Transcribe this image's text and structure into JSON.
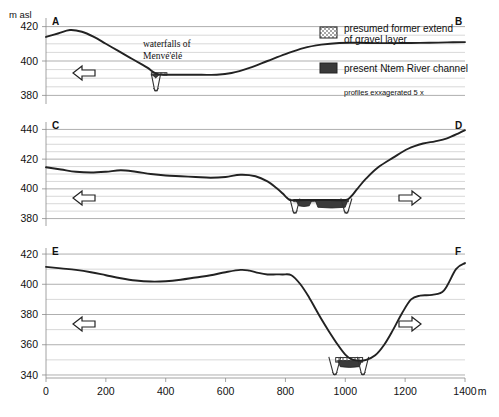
{
  "figure": {
    "y_axis_unit": "m asl",
    "x_axis_unit": "m"
  },
  "legend": {
    "items": [
      {
        "swatch": "gravel-stipple-swatch",
        "line1": "presumed former extend",
        "line2": "of gravel layer"
      },
      {
        "swatch": "channel-dark-swatch",
        "line1": "present Ntem River channel",
        "line2": ""
      }
    ],
    "note": "profiles exxagerated 5 x"
  },
  "annotations": {
    "waterfalls_line1": "waterfalls of",
    "waterfalls_line2": "Menvé'élé"
  },
  "x_ticks": [
    "0",
    "200",
    "400",
    "600",
    "800",
    "1000",
    "1200",
    "1400"
  ],
  "chart_data": {
    "type": "line",
    "title": "",
    "xlabel": "m",
    "ylabel": "m asl",
    "xlim": [
      0,
      1400
    ],
    "grid": true,
    "legend_position": "top-right",
    "note": "Three valley cross-section profiles of the Ntem River, vertically exaggerated 5x",
    "panels": [
      {
        "name": "panel-a",
        "left_label": "A",
        "right_label": "B",
        "ylim": [
          375,
          425
        ],
        "yticks": [
          380,
          400,
          420
        ],
        "yminor": [
          385,
          390,
          395,
          405,
          410,
          415
        ],
        "flow_arrow": "left",
        "x": [
          0,
          40,
          80,
          120,
          160,
          200,
          240,
          280,
          320,
          340,
          355,
          370,
          385,
          400,
          430,
          470,
          520,
          570,
          620,
          680,
          740,
          800,
          860,
          920,
          980,
          1040,
          1100,
          1160,
          1220,
          1280,
          1340,
          1400
        ],
        "y": [
          414,
          416,
          418,
          417,
          414,
          410,
          406,
          402,
          398,
          396,
          394,
          392.5,
          392.2,
          392,
          392,
          392,
          392,
          392,
          393,
          396,
          400,
          404,
          407.5,
          409.5,
          410.5,
          410.6,
          410.4,
          410.4,
          410.5,
          410.6,
          410.8,
          411
        ],
        "gravel_layer": {
          "x_start": 352,
          "x_end": 404,
          "y_top": 393.2,
          "y_bottom": 391.8
        },
        "channel": {
          "x_start": 355,
          "x_end": 378,
          "y_top": 392.2,
          "y_bottom": 390.6
        },
        "notch": {
          "x_start": 352,
          "x_end": 383,
          "y_top": 392.5,
          "y_bottom": 382.5
        }
      },
      {
        "name": "panel-c",
        "left_label": "C",
        "right_label": "D",
        "ylim": [
          375,
          445
        ],
        "yticks": [
          380,
          400,
          420,
          440
        ],
        "yminor": [
          385,
          390,
          395,
          405,
          410,
          415,
          425,
          430,
          435
        ],
        "flow_arrow_left": "left",
        "flow_arrow_right": "right",
        "x": [
          0,
          50,
          100,
          150,
          200,
          250,
          300,
          350,
          400,
          450,
          500,
          550,
          600,
          650,
          700,
          740,
          770,
          790,
          805,
          815,
          840,
          900,
          950,
          1000,
          1020,
          1040,
          1070,
          1110,
          1160,
          1210,
          1260,
          1300,
          1340,
          1380,
          1400
        ],
        "y": [
          414.5,
          413,
          411.5,
          411,
          411.5,
          412.5,
          411.5,
          410,
          409,
          408.5,
          408,
          407.5,
          408,
          409.5,
          408.5,
          405,
          400.5,
          397,
          394,
          392.5,
          392.3,
          392.5,
          392.5,
          392.4,
          395,
          400,
          407,
          414.5,
          421,
          427,
          430.5,
          432,
          434,
          437.5,
          439.5
        ],
        "gravel_layer": {
          "x_start": 828,
          "x_end": 1010,
          "y_top": 392.8,
          "y_bottom": 391.4
        },
        "channels": [
          {
            "x_start": 836,
            "x_end": 888,
            "y_top": 392.2,
            "y_bottom": 388.6
          },
          {
            "x_start": 900,
            "x_end": 1008,
            "y_top": 392.2,
            "y_bottom": 387.6
          }
        ],
        "notches": [
          {
            "x_start": 815,
            "x_end": 848,
            "y_top": 393.5,
            "y_bottom": 383.5
          },
          {
            "x_start": 985,
            "x_end": 1022,
            "y_top": 393.5,
            "y_bottom": 383.5
          }
        ]
      },
      {
        "name": "panel-e",
        "left_label": "E",
        "right_label": "F",
        "ylim": [
          338,
          424
        ],
        "yticks": [
          340,
          360,
          380,
          400,
          420
        ],
        "yminor": [
          350,
          370,
          390,
          410
        ],
        "flow_arrow_left": "left",
        "flow_arrow_right": "right",
        "x": [
          0,
          50,
          100,
          150,
          200,
          250,
          300,
          350,
          400,
          450,
          500,
          550,
          600,
          650,
          680,
          710,
          740,
          760,
          790,
          820,
          850,
          880,
          900,
          920,
          945,
          975,
          1000,
          1020,
          1045,
          1070,
          1100,
          1130,
          1160,
          1190,
          1220,
          1250,
          1290,
          1330,
          1370,
          1400
        ],
        "y": [
          411.5,
          410.5,
          409.5,
          408,
          406,
          404,
          402.5,
          401.8,
          402,
          403,
          404.5,
          406,
          408,
          409.5,
          409,
          407.5,
          406.5,
          406.5,
          406.5,
          406,
          400,
          391,
          384,
          377,
          369,
          360,
          353.5,
          350.5,
          349.5,
          350,
          353,
          360,
          370,
          381,
          390,
          392.5,
          393,
          396,
          410,
          414
        ],
        "gravel_layer": {
          "x_start": 968,
          "x_end": 1058,
          "y_top": 351.5,
          "y_bottom": 348.5
        },
        "channel": {
          "x_start": 975,
          "x_end": 1055,
          "y_top": 349.5,
          "y_bottom": 345.5
        },
        "notches": [
          {
            "x_start": 945,
            "x_end": 985,
            "y_top": 352,
            "y_bottom": 340
          },
          {
            "x_start": 1040,
            "x_end": 1078,
            "y_top": 352,
            "y_bottom": 340
          }
        ]
      }
    ]
  }
}
